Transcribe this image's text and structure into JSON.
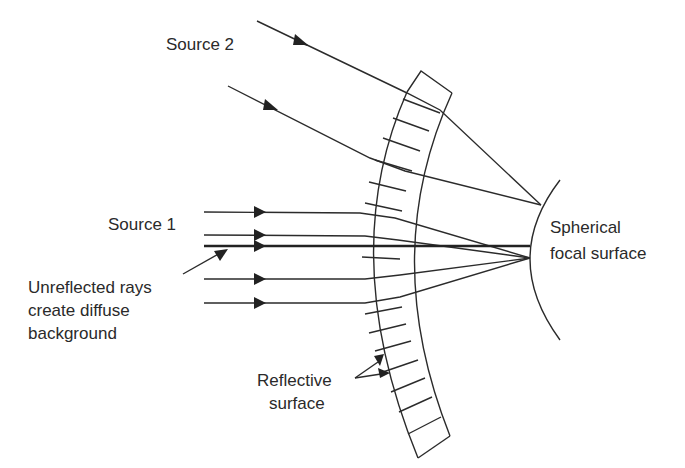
{
  "labels": {
    "source2": "Source 2",
    "source1": "Source 1",
    "unreflected_line1": "Unreflected rays",
    "unreflected_line2": "create diffuse",
    "unreflected_line3": "background",
    "focal_line1": "Spherical",
    "focal_line2": "focal surface",
    "reflective_line1": "Reflective",
    "reflective_line2": "surface"
  },
  "colors": {
    "stroke": "#2b2b2b",
    "text": "#2a2a2a",
    "background": "#ffffff"
  },
  "diagram": {
    "source1_ray_count": 5,
    "source2_ray_count": 2,
    "band_segments": 17
  }
}
